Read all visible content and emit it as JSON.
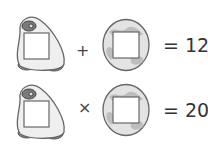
{
  "puzzle": {
    "rows": [
      {
        "left_symbol": "penguin",
        "operator": "+",
        "right_symbol": "planet",
        "result": "= 12"
      },
      {
        "left_symbol": "penguin",
        "operator": "×",
        "right_symbol": "planet",
        "result": "= 20"
      }
    ]
  },
  "colors": {
    "outline": "#555555",
    "penguin_fill": "#efefef",
    "penguin_dark": "#7a7a7a",
    "planet_fill": "#e2e2e2",
    "planet_spots": "#b8b8b8",
    "box_fill": "#ffffff"
  }
}
